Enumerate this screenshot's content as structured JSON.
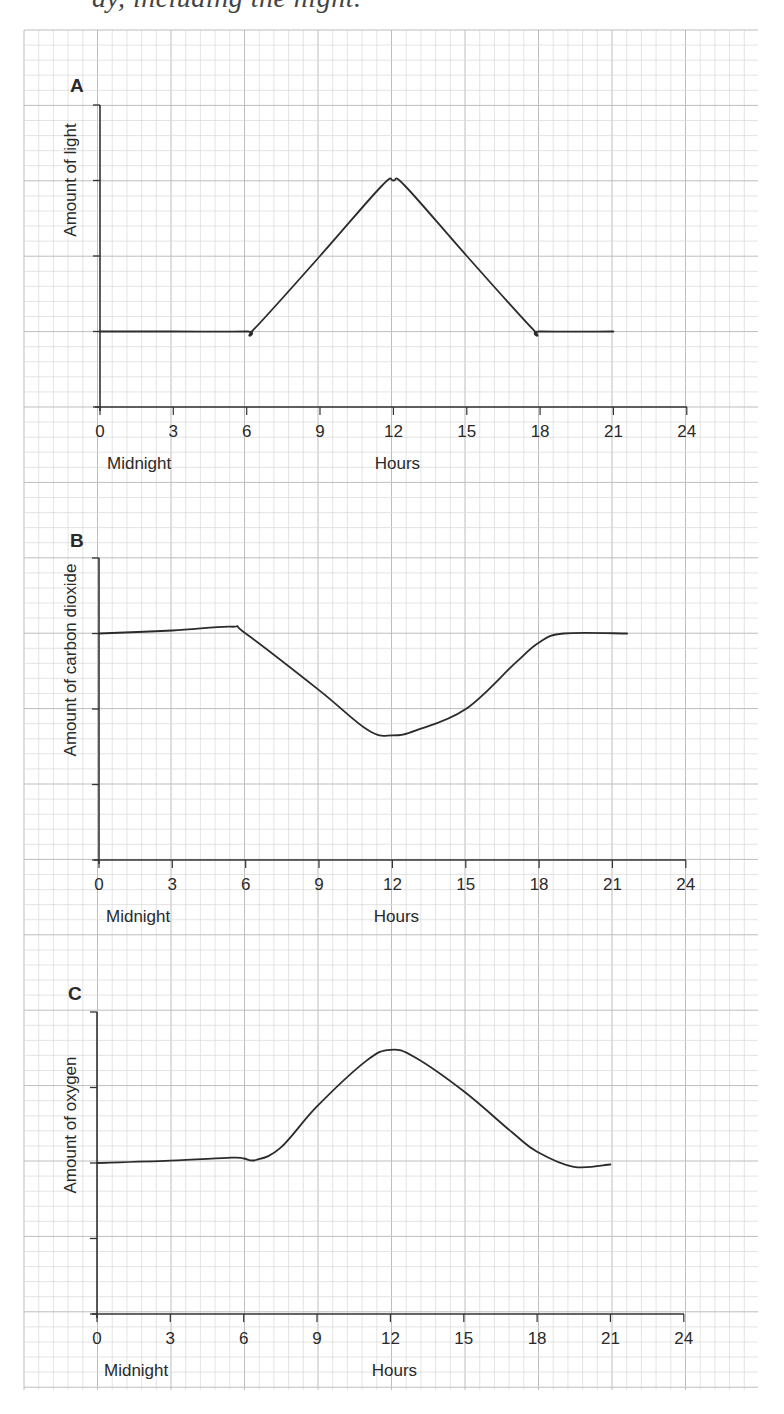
{
  "header": {
    "clipped_text": "ay, including the night."
  },
  "grid": {
    "left": 24,
    "top": 30,
    "right": 758,
    "bottom": 1390,
    "minor_x": 14.7,
    "minor_y": 15.08,
    "minor_color": "#d9d9d9",
    "major_color": "#bdbdbd"
  },
  "chart_data": [
    {
      "type": "line",
      "panel": "A",
      "title": "A",
      "xlabel": "Hours",
      "x_start_label": "Midnight",
      "ylabel": "Amount of light",
      "x_ticks": [
        0,
        3,
        6,
        9,
        12,
        15,
        18,
        21,
        24
      ],
      "xlim": [
        0,
        24
      ],
      "ylim": [
        0,
        4
      ],
      "y_ticks_unlabeled": 4,
      "grid": true,
      "series": [
        {
          "name": "Amount of light",
          "x": [
            0,
            3,
            6,
            6.3,
            9,
            11.5,
            12,
            12.5,
            15,
            17.7,
            18,
            21
          ],
          "y": [
            1,
            1,
            1,
            1.03,
            2,
            2.92,
            3,
            2.92,
            2,
            1.03,
            1,
            1
          ]
        }
      ]
    },
    {
      "type": "line",
      "panel": "B",
      "title": "B",
      "xlabel": "Hours",
      "x_start_label": "Midnight",
      "ylabel": "Amount of carbon dioxide",
      "x_ticks": [
        0,
        3,
        6,
        9,
        12,
        15,
        18,
        21,
        24
      ],
      "xlim": [
        0,
        24
      ],
      "ylim": [
        0,
        4
      ],
      "y_ticks_unlabeled": 4,
      "grid": true,
      "series": [
        {
          "name": "Amount of carbon dioxide",
          "x": [
            0,
            3,
            5.4,
            6,
            9,
            11,
            12,
            13,
            15,
            17,
            18,
            19,
            21.6
          ],
          "y": [
            3,
            3.04,
            3.09,
            3,
            2.25,
            1.72,
            1.65,
            1.72,
            2,
            2.6,
            2.88,
            3,
            3
          ]
        }
      ]
    },
    {
      "type": "line",
      "panel": "C",
      "title": "C",
      "xlabel": "Hours",
      "x_start_label": "Midnight",
      "ylabel": "Amount of oxygen",
      "x_ticks": [
        0,
        3,
        6,
        9,
        12,
        15,
        18,
        21,
        24
      ],
      "xlim": [
        0,
        24
      ],
      "ylim": [
        0,
        4
      ],
      "y_ticks_unlabeled": 4,
      "grid": true,
      "series": [
        {
          "name": "Amount of oxygen",
          "x": [
            0,
            3,
            5.5,
            6,
            6.5,
            7.5,
            9,
            11,
            12,
            13,
            15,
            17,
            18,
            19.5,
            21
          ],
          "y": [
            2,
            2.03,
            2.07,
            2.06,
            2.04,
            2.2,
            2.75,
            3.35,
            3.5,
            3.4,
            2.95,
            2.4,
            2.15,
            1.95,
            1.98
          ]
        }
      ]
    }
  ],
  "panels": [
    {
      "label": "A",
      "ylabel": "Amount of light",
      "xlabel": "Hours",
      "midnight": "Midnight",
      "ox": 100,
      "oy": 407,
      "ytop": 105,
      "xend": 687,
      "ylabel_x": 76,
      "ylabel_y": 180,
      "label_x": 70,
      "label_y": 92
    },
    {
      "label": "B",
      "ylabel": "Amount of carbon dioxide",
      "xlabel": "Hours",
      "midnight": "Midnight",
      "ox": 99,
      "oy": 860,
      "ytop": 558,
      "xend": 686,
      "ylabel_x": 76,
      "ylabel_y": 660,
      "label_x": 70,
      "label_y": 547
    },
    {
      "label": "C",
      "ylabel": "Amount of oxygen",
      "xlabel": "Hours",
      "midnight": "Midnight",
      "ox": 97,
      "oy": 1314,
      "ytop": 1012,
      "xend": 684,
      "ylabel_x": 76,
      "ylabel_y": 1125,
      "label_x": 68,
      "label_y": 1000
    }
  ],
  "axis": {
    "tick_labels": [
      "0",
      "3",
      "6",
      "9",
      "12",
      "15",
      "18",
      "21",
      "24"
    ],
    "px_per_hour": 24.45,
    "px_per_unit_y": 75.5
  },
  "colors": {
    "curve": "#2b2b2b",
    "axis": "#333333",
    "text": "#2a2a2a"
  }
}
